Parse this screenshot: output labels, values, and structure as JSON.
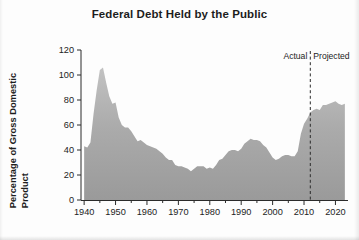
{
  "chart_data": {
    "type": "area",
    "title": "Federal Debt Held by the Public",
    "xlabel": "",
    "ylabel": "Percentage of Gross Domestic Product",
    "ylabel_lines": [
      "Percentage of Gross Domestic",
      "Product"
    ],
    "xlim": [
      1939,
      2024
    ],
    "ylim": [
      0,
      120
    ],
    "ytick_values": [
      0,
      20,
      40,
      60,
      80,
      100,
      120
    ],
    "ytick_labels": [
      "0",
      "20",
      "40",
      "60",
      "80",
      "100",
      "120"
    ],
    "xtick_values": [
      1940,
      1950,
      1960,
      1970,
      1980,
      1990,
      2000,
      2010,
      2020
    ],
    "xtick_labels": [
      "1940",
      "1950",
      "1960",
      "1970",
      "1980",
      "1990",
      "2000",
      "2010",
      "2020"
    ],
    "xtick_minor_values": [
      1945,
      1955,
      1965,
      1975,
      1985,
      1995,
      2005,
      2015
    ],
    "grid": false,
    "legend": false,
    "series_name": "Federal debt held by the public (% of GDP)",
    "fill_color": "#a9a9a9",
    "fill_color_top": "#c0c0c0",
    "fill_color_bottom": "#9b9b9b",
    "axis_color": "#2b2b2b",
    "x": [
      1940,
      1941,
      1942,
      1943,
      1944,
      1945,
      1946,
      1947,
      1948,
      1949,
      1950,
      1951,
      1952,
      1953,
      1954,
      1955,
      1956,
      1957,
      1958,
      1959,
      1960,
      1961,
      1962,
      1963,
      1964,
      1965,
      1966,
      1967,
      1968,
      1969,
      1970,
      1971,
      1972,
      1973,
      1974,
      1975,
      1976,
      1977,
      1978,
      1979,
      1980,
      1981,
      1982,
      1983,
      1984,
      1985,
      1986,
      1987,
      1988,
      1989,
      1990,
      1991,
      1992,
      1993,
      1994,
      1995,
      1996,
      1997,
      1998,
      1999,
      2000,
      2001,
      2002,
      2003,
      2004,
      2005,
      2006,
      2007,
      2008,
      2009,
      2010,
      2011,
      2012,
      2013,
      2014,
      2015,
      2016,
      2017,
      2018,
      2019,
      2020,
      2021,
      2022,
      2023
    ],
    "values": [
      43,
      42,
      46,
      69,
      88,
      104,
      106,
      94,
      83,
      77,
      78,
      66,
      60,
      58,
      58,
      55,
      51,
      47,
      48,
      46,
      44,
      43,
      42,
      41,
      39,
      37,
      34,
      32,
      32,
      28,
      27,
      27,
      26,
      25,
      23,
      25,
      27,
      27,
      27,
      25,
      26,
      25,
      28,
      32,
      33,
      36,
      39,
      40,
      40,
      39,
      41,
      45,
      47,
      49,
      48,
      48,
      47,
      44,
      42,
      38,
      34,
      32,
      33,
      35,
      36,
      36,
      35,
      35,
      39,
      53,
      61,
      65,
      70,
      72,
      73,
      72,
      76,
      76,
      77,
      78,
      79,
      77,
      76,
      77
    ],
    "annotations": [
      {
        "type": "vertical-divider",
        "x": 2012,
        "style": "dashed",
        "left_label": "Actual",
        "right_label": "Projected"
      }
    ]
  }
}
